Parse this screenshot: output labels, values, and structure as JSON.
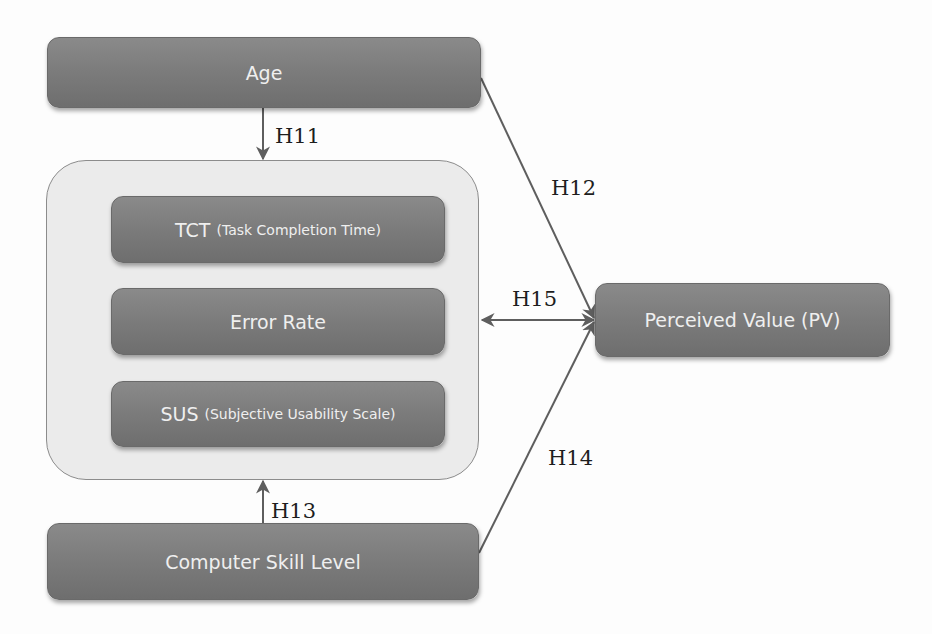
{
  "diagram": {
    "nodes": {
      "age": {
        "label": "Age"
      },
      "tct": {
        "label": "TCT",
        "sublabel": "(Task Completion Time)"
      },
      "error_rate": {
        "label": "Error Rate"
      },
      "sus": {
        "label": "SUS",
        "sublabel": "(Subjective Usability Scale)"
      },
      "computer_skill": {
        "label": "Computer Skill Level"
      },
      "perceived_value": {
        "label": "Perceived Value (PV)"
      }
    },
    "groups": {
      "usability_metrics": {
        "members": [
          "tct",
          "error_rate",
          "sus"
        ]
      }
    },
    "edges": [
      {
        "id": "H11",
        "label": "H11",
        "from": "age",
        "to": "usability_metrics",
        "direction": "forward"
      },
      {
        "id": "H12",
        "label": "H12",
        "from": "age",
        "to": "perceived_value",
        "direction": "forward"
      },
      {
        "id": "H13",
        "label": "H13",
        "from": "computer_skill",
        "to": "usability_metrics",
        "direction": "forward"
      },
      {
        "id": "H14",
        "label": "H14",
        "from": "computer_skill",
        "to": "perceived_value",
        "direction": "forward"
      },
      {
        "id": "H15",
        "label": "H15",
        "from": "usability_metrics",
        "to": "perceived_value",
        "direction": "bidirectional"
      }
    ],
    "colors": {
      "node_fill": "#7b7b7b",
      "node_text": "#efefef",
      "group_fill": "#ebebeb",
      "group_border": "#8c8c8c",
      "line": "#5e5e5e",
      "label_text": "#1e1e1e",
      "background": "#fdfdfd"
    }
  }
}
